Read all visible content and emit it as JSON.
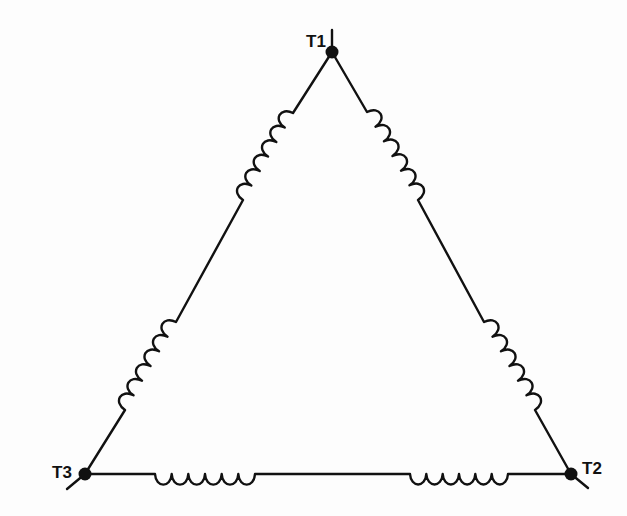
{
  "diagram": {
    "type": "delta-connected three-phase winding",
    "colors": {
      "ink": "#111111",
      "background": "#fdfdfd"
    },
    "terminals": [
      {
        "id": "T1",
        "label": "T1",
        "x": 332,
        "y": 52,
        "lead_to": [
          332,
          30
        ],
        "label_x": 306,
        "label_y": 47
      },
      {
        "id": "T2",
        "label": "T2",
        "x": 571,
        "y": 474,
        "lead_to": [
          588,
          488
        ],
        "label_x": 582,
        "label_y": 474
      },
      {
        "id": "T3",
        "label": "T3",
        "x": 85,
        "y": 474,
        "lead_to": [
          67,
          489
        ],
        "label_x": 52,
        "label_y": 478
      }
    ],
    "sides": [
      {
        "name": "left-side",
        "from": "T1",
        "to": "T3",
        "coils": [
          {
            "start": [
              293,
              113
            ],
            "end": [
              243,
              200
            ],
            "turns": 6
          },
          {
            "start": [
              176,
              322
            ],
            "end": [
              125,
              410
            ],
            "turns": 6
          }
        ]
      },
      {
        "name": "right-side",
        "from": "T1",
        "to": "T2",
        "coils": [
          {
            "start": [
              367,
              112
            ],
            "end": [
              418,
              200
            ],
            "turns": 6
          },
          {
            "start": [
              484,
              322
            ],
            "end": [
              535,
              410
            ],
            "turns": 6
          }
        ]
      },
      {
        "name": "bottom-side",
        "from": "T3",
        "to": "T2",
        "coils": [
          {
            "start": [
              155,
              474
            ],
            "end": [
              255,
              474
            ],
            "turns": 6
          },
          {
            "start": [
              410,
              474
            ],
            "end": [
              508,
              474
            ],
            "turns": 6
          }
        ]
      }
    ]
  }
}
